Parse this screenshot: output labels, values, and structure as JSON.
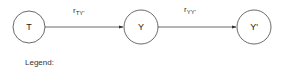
{
  "diagram": {
    "nodes": [
      {
        "id": "T",
        "label": "T"
      },
      {
        "id": "Y",
        "label": "Y"
      },
      {
        "id": "Yp",
        "label": "Y'"
      }
    ],
    "edges": [
      {
        "from": "T",
        "to": "Y",
        "label_main": "r",
        "label_sub": "TY'"
      },
      {
        "from": "Y",
        "to": "Yp",
        "label_main": "r",
        "label_sub": "YY'"
      }
    ],
    "legend": {
      "title": "Legend:"
    }
  }
}
